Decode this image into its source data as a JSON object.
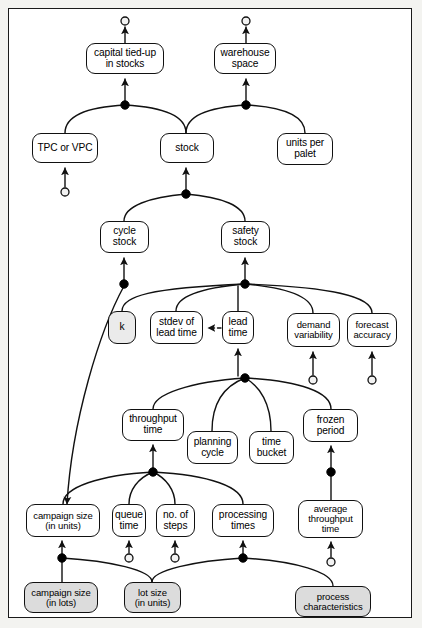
{
  "diagram": {
    "frame": {
      "stroke": "#1a1a1a"
    },
    "style": {
      "node_fill": "#ffffff",
      "shaded_fill": "#dcdcdc",
      "line_color": "#111111",
      "junction_fill": "#000000",
      "open_circle_fill": "#f2f2f2"
    },
    "nodes": [
      {
        "id": "capital",
        "label": "capital tied-up\nin stocks",
        "x": 86,
        "y": 43,
        "w": 78,
        "h": 31,
        "fill": "white",
        "font": "fs10"
      },
      {
        "id": "warehouse",
        "label": "warehouse\nspace",
        "x": 214,
        "y": 43,
        "w": 62,
        "h": 31,
        "fill": "white",
        "font": "fs10"
      },
      {
        "id": "tpc_vpc",
        "label": "TPC or VPC",
        "x": 32,
        "y": 133,
        "w": 66,
        "h": 30,
        "fill": "white",
        "font": "fs10"
      },
      {
        "id": "stock",
        "label": "stock",
        "x": 160,
        "y": 133,
        "w": 54,
        "h": 30,
        "fill": "white",
        "font": "fs10"
      },
      {
        "id": "units_palet",
        "label": "units per\npalet",
        "x": 277,
        "y": 133,
        "w": 56,
        "h": 32,
        "fill": "white",
        "font": "fs10"
      },
      {
        "id": "cycle_stock",
        "label": "cycle\nstock",
        "x": 100,
        "y": 221,
        "w": 49,
        "h": 32,
        "fill": "white",
        "font": "fs10"
      },
      {
        "id": "safety_stock",
        "label": "safety\nstock",
        "x": 221,
        "y": 221,
        "w": 49,
        "h": 32,
        "fill": "white",
        "font": "fs10"
      },
      {
        "id": "k",
        "label": "k",
        "x": 108,
        "y": 311,
        "w": 28,
        "h": 33,
        "fill": "shaded-light",
        "font": "fs10"
      },
      {
        "id": "stdev_lt",
        "label": "stdev of\nlead time",
        "x": 150,
        "y": 311,
        "w": 53,
        "h": 33,
        "fill": "white",
        "font": "fs10"
      },
      {
        "id": "lead_time",
        "label": "lead\ntime",
        "x": 222,
        "y": 311,
        "w": 32,
        "h": 33,
        "fill": "white",
        "font": "fs10"
      },
      {
        "id": "demand_var",
        "label": "demand\nvariability",
        "x": 287,
        "y": 313,
        "w": 53,
        "h": 34,
        "fill": "white",
        "font": "fs9"
      },
      {
        "id": "forecast_acc",
        "label": "forecast\naccuracy",
        "x": 347,
        "y": 313,
        "w": 50,
        "h": 34,
        "fill": "white",
        "font": "fs9"
      },
      {
        "id": "throughput",
        "label": "throughput\ntime",
        "x": 122,
        "y": 409,
        "w": 62,
        "h": 32,
        "fill": "white",
        "font": "fs10"
      },
      {
        "id": "planning",
        "label": "planning\ncycle",
        "x": 187,
        "y": 431,
        "w": 51,
        "h": 33,
        "fill": "white",
        "font": "fs10"
      },
      {
        "id": "time_bucket",
        "label": "time\nbucket",
        "x": 249,
        "y": 431,
        "w": 45,
        "h": 33,
        "fill": "white",
        "font": "fs10"
      },
      {
        "id": "frozen",
        "label": "frozen\nperiod",
        "x": 303,
        "y": 409,
        "w": 55,
        "h": 33,
        "fill": "white",
        "font": "fs10"
      },
      {
        "id": "camp_units",
        "label": "campaign size\n(in units)",
        "x": 26,
        "y": 504,
        "w": 74,
        "h": 33,
        "fill": "white",
        "font": "fs9"
      },
      {
        "id": "queue_time",
        "label": "queue\ntime",
        "x": 112,
        "y": 504,
        "w": 34,
        "h": 33,
        "fill": "white",
        "font": "fs10"
      },
      {
        "id": "no_steps",
        "label": "no. of\nsteps",
        "x": 156,
        "y": 504,
        "w": 39,
        "h": 33,
        "fill": "white",
        "font": "fs10"
      },
      {
        "id": "proc_times",
        "label": "processing\ntimes",
        "x": 212,
        "y": 504,
        "w": 62,
        "h": 33,
        "fill": "white",
        "font": "fs10"
      },
      {
        "id": "avg_through",
        "label": "average\nthroughput\ntime",
        "x": 298,
        "y": 500,
        "w": 65,
        "h": 38,
        "fill": "white",
        "font": "fs9"
      },
      {
        "id": "camp_lots",
        "label": "campaign size\n(in lots)",
        "x": 24,
        "y": 582,
        "w": 74,
        "h": 31,
        "fill": "shaded",
        "font": "fs9"
      },
      {
        "id": "lot_units",
        "label": "lot size\n(in units)",
        "x": 124,
        "y": 582,
        "w": 57,
        "h": 31,
        "fill": "shaded",
        "font": "fs9"
      },
      {
        "id": "proc_char",
        "label": "process\ncharacteristics",
        "x": 295,
        "y": 586,
        "w": 76,
        "h": 31,
        "fill": "shaded",
        "font": "fs9"
      }
    ],
    "junctions": [
      {
        "id": "j-capital",
        "x": 125,
        "y": 105
      },
      {
        "id": "j-warehouse",
        "x": 246,
        "y": 105
      },
      {
        "id": "j-stock",
        "x": 186,
        "y": 194
      },
      {
        "id": "j-cycle",
        "x": 124,
        "y": 284
      },
      {
        "id": "j-safety",
        "x": 245,
        "y": 284
      },
      {
        "id": "j-leadtime",
        "x": 245,
        "y": 378
      },
      {
        "id": "j-through",
        "x": 153,
        "y": 472
      },
      {
        "id": "j-frozen",
        "x": 331,
        "y": 472
      },
      {
        "id": "j-campaign",
        "x": 62,
        "y": 558
      },
      {
        "id": "j-proc",
        "x": 243,
        "y": 558
      }
    ],
    "terminals": [
      {
        "id": "t-capital",
        "x": 125,
        "y": 21
      },
      {
        "id": "t-warehouse",
        "x": 246,
        "y": 21
      },
      {
        "id": "t-tpc",
        "x": 65,
        "y": 192
      },
      {
        "id": "t-demand",
        "x": 313,
        "y": 380
      },
      {
        "id": "t-forecast",
        "x": 372,
        "y": 380
      },
      {
        "id": "t-queue",
        "x": 129,
        "y": 558
      },
      {
        "id": "t-steps",
        "x": 175,
        "y": 558
      },
      {
        "id": "t-avg",
        "x": 331,
        "y": 562
      }
    ],
    "edges": [
      {
        "from": "capital",
        "to": "t-capital",
        "kind": "arrow"
      },
      {
        "from": "warehouse",
        "to": "t-warehouse",
        "kind": "arrow"
      },
      {
        "from": "j-capital",
        "to": "capital",
        "kind": "arrow"
      },
      {
        "from": "j-warehouse",
        "to": "warehouse",
        "kind": "arrow"
      },
      {
        "from": "tpc_vpc",
        "to": "j-capital",
        "kind": "curve"
      },
      {
        "from": "stock",
        "to": "j-capital",
        "kind": "curve"
      },
      {
        "from": "stock",
        "to": "j-warehouse",
        "kind": "curve"
      },
      {
        "from": "units_palet",
        "to": "j-warehouse",
        "kind": "curve"
      },
      {
        "from": "t-tpc",
        "to": "tpc_vpc",
        "kind": "arrow"
      },
      {
        "from": "j-stock",
        "to": "stock",
        "kind": "arrow"
      },
      {
        "from": "cycle_stock",
        "to": "j-stock",
        "kind": "curve"
      },
      {
        "from": "safety_stock",
        "to": "j-stock",
        "kind": "curve"
      },
      {
        "from": "j-cycle",
        "to": "cycle_stock",
        "kind": "arrow"
      },
      {
        "from": "j-safety",
        "to": "safety_stock",
        "kind": "arrow"
      },
      {
        "from": "k",
        "to": "j-safety",
        "kind": "curve"
      },
      {
        "from": "stdev_lt",
        "to": "j-safety",
        "kind": "curve"
      },
      {
        "from": "lead_time",
        "to": "j-safety",
        "kind": "line"
      },
      {
        "from": "demand_var",
        "to": "j-safety",
        "kind": "curve"
      },
      {
        "from": "forecast_acc",
        "to": "j-safety",
        "kind": "curve"
      },
      {
        "from": "lead_time",
        "to": "stdev_lt",
        "kind": "dashed-arrow"
      },
      {
        "from": "t-demand",
        "to": "demand_var",
        "kind": "arrow"
      },
      {
        "from": "t-forecast",
        "to": "forecast_acc",
        "kind": "arrow"
      },
      {
        "from": "j-leadtime",
        "to": "lead_time",
        "kind": "arrow"
      },
      {
        "from": "throughput",
        "to": "j-leadtime",
        "kind": "curve"
      },
      {
        "from": "planning",
        "to": "j-leadtime",
        "kind": "curve"
      },
      {
        "from": "time_bucket",
        "to": "j-leadtime",
        "kind": "curve"
      },
      {
        "from": "frozen",
        "to": "j-leadtime",
        "kind": "curve"
      },
      {
        "from": "j-through",
        "to": "throughput",
        "kind": "arrow"
      },
      {
        "from": "camp_units",
        "to": "j-through",
        "kind": "curve"
      },
      {
        "from": "queue_time",
        "to": "j-through",
        "kind": "curve"
      },
      {
        "from": "no_steps",
        "to": "j-through",
        "kind": "curve"
      },
      {
        "from": "proc_times",
        "to": "j-through",
        "kind": "curve"
      },
      {
        "from": "j-frozen",
        "to": "frozen",
        "kind": "arrow"
      },
      {
        "from": "avg_through",
        "to": "j-frozen",
        "kind": "line"
      },
      {
        "from": "j-campaign",
        "to": "camp_units",
        "kind": "arrow"
      },
      {
        "from": "camp_lots",
        "to": "j-campaign",
        "kind": "line"
      },
      {
        "from": "lot_units",
        "to": "j-campaign",
        "kind": "curve"
      },
      {
        "from": "t-queue",
        "to": "queue_time",
        "kind": "arrow"
      },
      {
        "from": "t-steps",
        "to": "no_steps",
        "kind": "arrow"
      },
      {
        "from": "j-proc",
        "to": "proc_times",
        "kind": "arrow"
      },
      {
        "from": "lot_units",
        "to": "j-proc",
        "kind": "curve"
      },
      {
        "from": "proc_char",
        "to": "j-proc",
        "kind": "curve"
      },
      {
        "from": "t-avg",
        "to": "avg_through",
        "kind": "arrow"
      },
      {
        "from": "cycle_stock_tail",
        "to": "camp_units",
        "kind": "long-curve"
      },
      {
        "from": "proc_char",
        "to": "avg_through",
        "kind": "curve"
      }
    ]
  }
}
